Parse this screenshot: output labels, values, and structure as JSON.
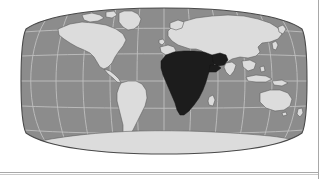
{
  "figure": {
    "kind": "world-map",
    "projection": "robinson",
    "title": "",
    "caption": "",
    "highlighted_region": "Africa",
    "colors": {
      "page_background": "#ffffff",
      "ocean": "#8c8c8c",
      "land": "#dcdcdc",
      "land_outline": "#5a5a5a",
      "highlight": "#1c1c1c",
      "graticule": "#bfbfbf",
      "map_outline": "#4a4a4a",
      "rule": "#a8a8a8"
    },
    "graticule": {
      "visible": true,
      "meridian_spacing_deg": 30,
      "parallel_spacing_deg": 30,
      "meridians": [
        -180,
        -150,
        -120,
        -90,
        -60,
        -30,
        0,
        30,
        60,
        90,
        120,
        150,
        180
      ],
      "parallels": [
        -60,
        -30,
        0,
        30,
        60
      ]
    },
    "landmasses": [
      {
        "name": "north-america",
        "highlighted": false
      },
      {
        "name": "south-america",
        "highlighted": false
      },
      {
        "name": "greenland",
        "highlighted": false
      },
      {
        "name": "eurasia",
        "highlighted": false
      },
      {
        "name": "africa",
        "highlighted": true
      },
      {
        "name": "arabian-peninsula",
        "highlighted": true
      },
      {
        "name": "madagascar",
        "highlighted": false
      },
      {
        "name": "australia",
        "highlighted": false
      },
      {
        "name": "antarctica",
        "highlighted": false
      },
      {
        "name": "british-isles",
        "highlighted": false
      },
      {
        "name": "japan",
        "highlighted": false
      },
      {
        "name": "indonesia",
        "highlighted": false
      },
      {
        "name": "new-zealand",
        "highlighted": false
      }
    ]
  },
  "rules": {
    "right_border": true,
    "bottom_border": true
  }
}
